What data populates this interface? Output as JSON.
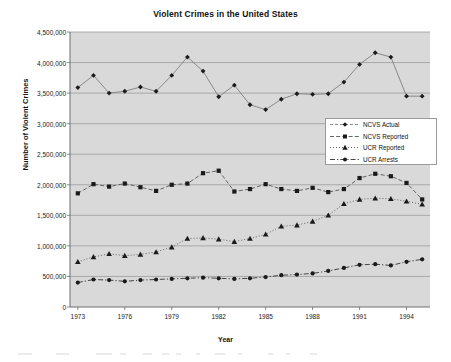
{
  "chart_data": {
    "type": "line",
    "title": "Violent Crimes in the United States",
    "xlabel": "Year",
    "ylabel": "Number of Violent Crimes",
    "grid": true,
    "legend_position": "center-right",
    "xlim": [
      1972.5,
      1995.5
    ],
    "ylim": [
      0,
      4500000
    ],
    "xticks": [
      "1973",
      "1976",
      "1979",
      "1982",
      "1985",
      "1988",
      "1991",
      "1994"
    ],
    "xtick_values": [
      1973,
      1976,
      1979,
      1982,
      1985,
      1988,
      1991,
      1994
    ],
    "yticks": [
      "0",
      "500,000",
      "1,000,000",
      "1,500,000",
      "2,000,000",
      "2,500,000",
      "3,000,000",
      "3,500,000",
      "4,000,000",
      "4,500,000"
    ],
    "ytick_values": [
      0,
      500000,
      1000000,
      1500000,
      2000000,
      2500000,
      3000000,
      3500000,
      4000000,
      4500000
    ],
    "x": [
      1973,
      1974,
      1975,
      1976,
      1977,
      1978,
      1979,
      1980,
      1981,
      1982,
      1983,
      1984,
      1985,
      1986,
      1987,
      1988,
      1989,
      1990,
      1991,
      1992,
      1993,
      1994,
      1995
    ],
    "series": [
      {
        "name": "NCVS Actual",
        "marker": "diamond",
        "line": "solid",
        "color": "#7f7f7f",
        "values": [
          3590000,
          3790000,
          3500000,
          3530000,
          3600000,
          3530000,
          3790000,
          4090000,
          3860000,
          3440000,
          3630000,
          3310000,
          3230000,
          3400000,
          3490000,
          3480000,
          3490000,
          3680000,
          3970000,
          4160000,
          4090000,
          3450000,
          3450000
        ]
      },
      {
        "name": "NCVS Reported",
        "marker": "square",
        "line": "dashed",
        "color": "#555555",
        "values": [
          1860000,
          2010000,
          1970000,
          2020000,
          1960000,
          1900000,
          2000000,
          2020000,
          2190000,
          2230000,
          1890000,
          1930000,
          2010000,
          1930000,
          1900000,
          1950000,
          1880000,
          1930000,
          2110000,
          2180000,
          2140000,
          2030000,
          1760000
        ]
      },
      {
        "name": "UCR Reported",
        "marker": "triangle",
        "line": "dotted",
        "color": "#555555",
        "values": [
          740000,
          820000,
          870000,
          840000,
          860000,
          900000,
          980000,
          1120000,
          1130000,
          1110000,
          1070000,
          1120000,
          1190000,
          1320000,
          1340000,
          1400000,
          1500000,
          1690000,
          1760000,
          1780000,
          1770000,
          1730000,
          1680000
        ]
      },
      {
        "name": "UCR Arrests",
        "marker": "circle",
        "line": "dash-dot",
        "color": "#333333",
        "values": [
          400000,
          450000,
          440000,
          420000,
          440000,
          450000,
          460000,
          470000,
          480000,
          470000,
          460000,
          470000,
          490000,
          520000,
          530000,
          550000,
          590000,
          640000,
          690000,
          700000,
          680000,
          740000,
          780000
        ]
      }
    ]
  },
  "legend": {
    "items": [
      {
        "label": "NCVS Actual"
      },
      {
        "label": "NCVS Reported"
      },
      {
        "label": "UCR Reported"
      },
      {
        "label": "UCR Arrests"
      }
    ]
  },
  "colors": {
    "plot_background": "#d9d9d9",
    "grid": "#9c9c9c",
    "axis": "#6e6e6e",
    "marker": "#1a1a1a",
    "page_background": "#ffffff"
  }
}
